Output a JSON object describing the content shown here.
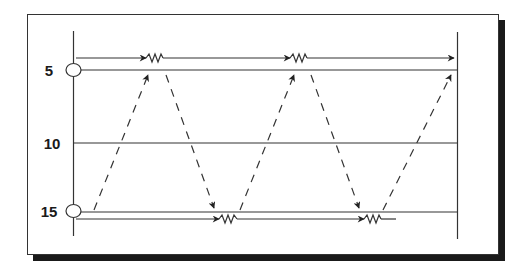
{
  "diagram": {
    "type": "flow-schematic",
    "levels": [
      {
        "label": "5",
        "y": 70
      },
      {
        "label": "10",
        "y": 143
      },
      {
        "label": "15",
        "y": 212
      }
    ],
    "colors": {
      "line": "#333333",
      "shadow": "#1a1a1a",
      "background": "#ffffff"
    },
    "elements": {
      "top_flow_line": "arrow line with two resistors, flowing right",
      "bottom_flow_line": "arrow line with two resistors, flowing right",
      "dashed_zigzag": "dashed arrows zig-zagging between level 15 and level 5"
    }
  }
}
